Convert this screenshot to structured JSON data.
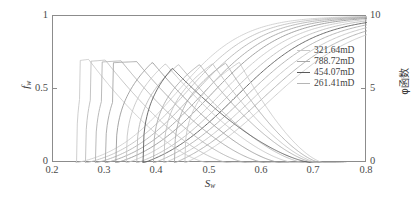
{
  "chart_data": {
    "type": "line",
    "title": "",
    "xlabel": "Sw",
    "ylabel_left": "fw",
    "ylabel_right": "φ函数",
    "xlim": [
      0.2,
      0.8
    ],
    "ylim_left": [
      0,
      1
    ],
    "ylim_right": [
      0,
      10
    ],
    "xticks": [
      "0.2",
      "0.3",
      "0.4",
      "0.5",
      "0.6",
      "0.7",
      "0.8"
    ],
    "xtick_values": [
      0.2,
      0.3,
      0.4,
      0.5,
      0.6,
      0.7,
      0.8
    ],
    "yticks_left": [
      "0",
      "0.5",
      "1"
    ],
    "ytick_left_values": [
      0,
      0.5,
      1
    ],
    "yticks_right": [
      "0",
      "5",
      "10"
    ],
    "ytick_right_values": [
      0,
      5,
      10
    ],
    "grid": false,
    "legend_position": "upper-right",
    "legend": [
      {
        "label": "321.64mD",
        "color": "#c9c9c9"
      },
      {
        "label": "788.72mD",
        "color": "#a8a8a8"
      },
      {
        "label": "454.07mD",
        "color": "#5a5a5a"
      },
      {
        "label": "261.41mD",
        "color": "#b5b5b5"
      }
    ],
    "series": [
      {
        "name": "fw-1",
        "kind": "fractional-flow",
        "axis": "left",
        "color": "#cfcfcf",
        "sw_start": 0.243,
        "sw_mid": 0.435,
        "steep": 15.5,
        "sw_end": 0.8
      },
      {
        "name": "fw-2",
        "kind": "fractional-flow",
        "axis": "left",
        "color": "#c2c2c2",
        "sw_start": 0.262,
        "sw_mid": 0.452,
        "steep": 15.0,
        "sw_end": 0.8
      },
      {
        "name": "fw-3",
        "kind": "fractional-flow",
        "axis": "left",
        "color": "#b4b4b4",
        "sw_start": 0.281,
        "sw_mid": 0.468,
        "steep": 14.6,
        "sw_end": 0.8
      },
      {
        "name": "fw-4",
        "kind": "fractional-flow",
        "axis": "left",
        "color": "#a6a6a6",
        "sw_start": 0.3,
        "sw_mid": 0.484,
        "steep": 14.2,
        "sw_end": 0.8
      },
      {
        "name": "fw-5",
        "kind": "fractional-flow",
        "axis": "left",
        "color": "#999999",
        "sw_start": 0.32,
        "sw_mid": 0.5,
        "steep": 13.8,
        "sw_end": 0.8
      },
      {
        "name": "fw-6",
        "kind": "fractional-flow",
        "axis": "left",
        "color": "#c8c8c8",
        "sw_start": 0.34,
        "sw_mid": 0.516,
        "steep": 13.4,
        "sw_end": 0.8
      },
      {
        "name": "fw-7",
        "kind": "fractional-flow",
        "axis": "left",
        "color": "#bcbcbc",
        "sw_start": 0.36,
        "sw_mid": 0.532,
        "steep": 13.0,
        "sw_end": 0.8
      },
      {
        "name": "fw-8",
        "kind": "fractional-flow",
        "axis": "left",
        "color": "#5d5d5d",
        "sw_start": 0.372,
        "sw_mid": 0.548,
        "steep": 12.6,
        "sw_end": 0.8
      },
      {
        "name": "fw-9",
        "kind": "fractional-flow",
        "axis": "left",
        "color": "#b0b0b0",
        "sw_start": 0.392,
        "sw_mid": 0.564,
        "steep": 12.2,
        "sw_end": 0.8
      },
      {
        "name": "fw-10",
        "kind": "fractional-flow",
        "axis": "left",
        "color": "#c4c4c4",
        "sw_start": 0.412,
        "sw_mid": 0.58,
        "steep": 11.8,
        "sw_end": 0.8
      },
      {
        "name": "fw-11",
        "kind": "fractional-flow",
        "axis": "left",
        "color": "#aeaeae",
        "sw_start": 0.432,
        "sw_mid": 0.596,
        "steep": 11.5,
        "sw_end": 0.8
      },
      {
        "name": "fw-12",
        "kind": "fractional-flow",
        "axis": "left",
        "color": "#cacaca",
        "sw_start": 0.452,
        "sw_mid": 0.612,
        "steep": 11.2,
        "sw_end": 0.8
      },
      {
        "name": "phi-1",
        "kind": "phi",
        "axis": "right",
        "color": "#c9c9c9",
        "peak_sw": 0.268,
        "peak_val": 7.05,
        "left_sw": 0.245,
        "right_sw": 0.5,
        "flat": true
      },
      {
        "name": "phi-2",
        "kind": "phi",
        "axis": "right",
        "color": "#bdbdbd",
        "peak_sw": 0.3,
        "peak_val": 7.0,
        "left_sw": 0.262,
        "right_sw": 0.54,
        "flat": true
      },
      {
        "name": "phi-3",
        "kind": "phi",
        "axis": "right",
        "color": "#b2b2b2",
        "peak_sw": 0.33,
        "peak_val": 6.95,
        "left_sw": 0.281,
        "right_sw": 0.575,
        "flat": true
      },
      {
        "name": "phi-4",
        "kind": "phi",
        "axis": "right",
        "color": "#a6a6a6",
        "peak_sw": 0.36,
        "peak_val": 6.9,
        "left_sw": 0.3,
        "right_sw": 0.61,
        "flat": true
      },
      {
        "name": "phi-5",
        "kind": "phi",
        "axis": "right",
        "color": "#9b9b9b",
        "peak_sw": 0.39,
        "peak_val": 6.85,
        "left_sw": 0.32,
        "right_sw": 0.64,
        "flat": false
      },
      {
        "name": "phi-6",
        "kind": "phi",
        "axis": "right",
        "color": "#c6c6c6",
        "peak_sw": 0.415,
        "peak_val": 6.75,
        "left_sw": 0.34,
        "right_sw": 0.665,
        "flat": false
      },
      {
        "name": "phi-7",
        "kind": "phi",
        "axis": "right",
        "color": "#bababa",
        "peak_sw": 0.44,
        "peak_val": 6.7,
        "left_sw": 0.36,
        "right_sw": 0.685,
        "flat": false
      },
      {
        "name": "phi-8",
        "kind": "phi",
        "axis": "right",
        "color": "#5d5d5d",
        "peak_sw": 0.428,
        "peak_val": 6.45,
        "left_sw": 0.372,
        "right_sw": 0.7,
        "flat": false
      },
      {
        "name": "phi-9",
        "kind": "phi",
        "axis": "right",
        "color": "#aeaeae",
        "peak_sw": 0.48,
        "peak_val": 6.7,
        "left_sw": 0.392,
        "right_sw": 0.705,
        "flat": false
      },
      {
        "name": "phi-10",
        "kind": "phi",
        "axis": "right",
        "color": "#c2c2c2",
        "peak_sw": 0.505,
        "peak_val": 6.75,
        "left_sw": 0.412,
        "right_sw": 0.71,
        "flat": false
      },
      {
        "name": "phi-11",
        "kind": "phi",
        "axis": "right",
        "color": "#adadad",
        "peak_sw": 0.53,
        "peak_val": 6.8,
        "left_sw": 0.432,
        "right_sw": 0.715,
        "flat": false
      },
      {
        "name": "phi-12",
        "kind": "phi",
        "axis": "right",
        "color": "#c8c8c8",
        "peak_sw": 0.556,
        "peak_val": 6.85,
        "left_sw": 0.452,
        "right_sw": 0.72,
        "flat": false
      }
    ]
  },
  "axes": {
    "frame_color": "#8c8c8c"
  }
}
